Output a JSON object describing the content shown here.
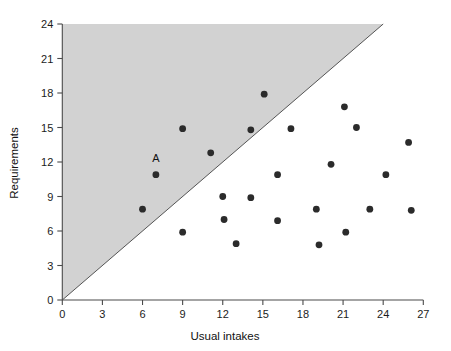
{
  "chart_data": {
    "type": "scatter",
    "title": "",
    "xlabel": "Usual intakes",
    "ylabel": "Requirements",
    "xlim": [
      0,
      27
    ],
    "ylim": [
      0,
      24
    ],
    "xticks": [
      0,
      3,
      6,
      9,
      12,
      15,
      18,
      21,
      24,
      27
    ],
    "yticks": [
      0,
      3,
      6,
      9,
      12,
      15,
      18,
      21,
      24
    ],
    "grid": false,
    "legend": "none",
    "annotations": [
      {
        "text": "A",
        "x": 7.0,
        "y": 12.0,
        "describes_point": {
          "x": 7.0,
          "y": 10.9
        }
      }
    ],
    "reference_line": {
      "name": "identity-line",
      "description": "y = x diagonal from (0,0) to (24,24)",
      "from": [
        0,
        0
      ],
      "to": [
        24,
        24
      ]
    },
    "shaded_region": {
      "name": "requirements-exceed-intake-region",
      "description": "Region above the y = x line (requirements greater than usual intake)",
      "color": "#d2d2d2"
    },
    "point_color": "#2b2b2b",
    "points": [
      {
        "x": 6.0,
        "y": 7.9
      },
      {
        "x": 7.0,
        "y": 10.9,
        "label": "A"
      },
      {
        "x": 9.0,
        "y": 14.9
      },
      {
        "x": 9.0,
        "y": 5.9
      },
      {
        "x": 11.1,
        "y": 12.8
      },
      {
        "x": 12.0,
        "y": 9.0
      },
      {
        "x": 12.1,
        "y": 7.0
      },
      {
        "x": 13.0,
        "y": 4.9
      },
      {
        "x": 14.1,
        "y": 14.8
      },
      {
        "x": 14.1,
        "y": 8.9
      },
      {
        "x": 15.1,
        "y": 17.9
      },
      {
        "x": 16.1,
        "y": 10.9
      },
      {
        "x": 16.1,
        "y": 6.9
      },
      {
        "x": 17.1,
        "y": 14.9
      },
      {
        "x": 19.0,
        "y": 7.9
      },
      {
        "x": 19.2,
        "y": 4.8
      },
      {
        "x": 20.1,
        "y": 11.8
      },
      {
        "x": 21.1,
        "y": 16.8
      },
      {
        "x": 21.2,
        "y": 5.9
      },
      {
        "x": 22.0,
        "y": 15.0
      },
      {
        "x": 23.0,
        "y": 7.9
      },
      {
        "x": 24.2,
        "y": 10.9
      },
      {
        "x": 25.9,
        "y": 13.7
      },
      {
        "x": 26.1,
        "y": 7.8
      }
    ]
  },
  "axes": {
    "x_title": "Usual intakes",
    "y_title": "Requirements",
    "x_tick_labels": [
      "0",
      "3",
      "6",
      "9",
      "12",
      "15",
      "18",
      "21",
      "24",
      "27"
    ],
    "y_tick_labels": [
      "0",
      "3",
      "6",
      "9",
      "12",
      "15",
      "18",
      "21",
      "24"
    ]
  }
}
